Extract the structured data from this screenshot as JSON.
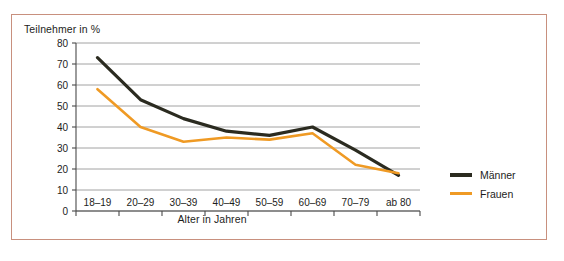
{
  "figure": {
    "border_color": "#c8907e",
    "background": "#ffffff"
  },
  "legend": {
    "position": "right",
    "entries": [
      {
        "label": "Männer",
        "color": "#2b2b20"
      },
      {
        "label": "Frauen",
        "color": "#ef9a24"
      }
    ]
  },
  "chart_data": {
    "type": "line",
    "title": "",
    "xlabel": "Alter in Jahren",
    "ylabel": "Teilnehmer in %",
    "categories": [
      "18–19",
      "20–29",
      "30–39",
      "40–49",
      "50–59",
      "60–69",
      "70–79",
      "ab 80"
    ],
    "ylim": [
      0,
      80
    ],
    "yticks": [
      0,
      10,
      20,
      30,
      40,
      50,
      60,
      70,
      80
    ],
    "ytick_labels": [
      "0",
      "10",
      "20",
      "30",
      "40",
      "50",
      "60",
      "70",
      "80"
    ],
    "grid": true,
    "grid_axis": "y",
    "legend_position": "right",
    "series": [
      {
        "name": "Männer",
        "color": "#2b2b20",
        "values": [
          73,
          53,
          44,
          38,
          36,
          40,
          29,
          17
        ]
      },
      {
        "name": "Frauen",
        "color": "#ef9a24",
        "values": [
          58,
          40,
          33,
          35,
          34,
          37,
          22,
          18
        ]
      }
    ]
  }
}
